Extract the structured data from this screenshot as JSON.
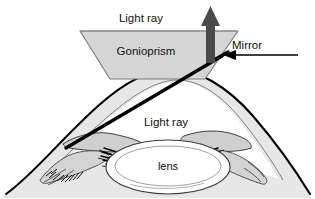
{
  "figure": {
    "name": "gonioscopy-diagram",
    "background_color": "#ffffff"
  },
  "labels": {
    "light_ray_top": "Light ray",
    "gonioprism": "Gonioprism",
    "mirror": "Mirror",
    "light_ray_inner": "Light ray",
    "lens": "lens"
  },
  "colors": {
    "outline": "#000000",
    "thin_outline": "#555555",
    "prism_fill": "#d6d6d6",
    "prism_stroke": "#6e6e6e",
    "tissue_fill": "#d9d9d9",
    "tissue_stroke": "#333333",
    "ray_arrow": "#4a4a4a",
    "mirror_arrow": "#000000",
    "light_ray_line": "#000000",
    "text": "#111111"
  },
  "elements": {
    "gonioprism_shape": "trapezoid",
    "light_ray_arrow_direction": "up",
    "mirror_arrow_direction": "left",
    "light_ray_line_direction": "lower-left-to-upper-right",
    "lens_shape": "ellipse"
  },
  "icons": {
    "up_arrow": "up-arrow-icon",
    "left_arrow": "left-arrow-icon"
  }
}
